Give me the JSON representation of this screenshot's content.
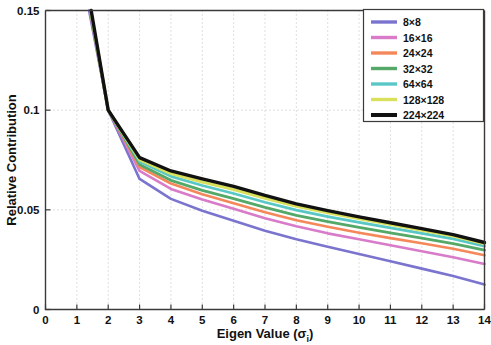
{
  "chart_data": {
    "type": "line",
    "title": "",
    "xlabel": "Eigen Value (σᵢ)",
    "ylabel": "Relative Contribution",
    "xlim": [
      0,
      14
    ],
    "ylim": [
      0,
      0.15
    ],
    "xticks": [
      "0",
      "1",
      "2",
      "3",
      "4",
      "5",
      "6",
      "7",
      "8",
      "9",
      "10",
      "11",
      "12",
      "13",
      "14"
    ],
    "yticks": [
      "0",
      "0.05",
      "0.1",
      "0.15"
    ],
    "ytick_values": [
      0,
      0.05,
      0.1,
      0.15
    ],
    "grid": true,
    "grid_style": "dotted",
    "legend_position": "top-right",
    "x": [
      1,
      2,
      3,
      4,
      5,
      6,
      7,
      8,
      9,
      10,
      11,
      12,
      13,
      14
    ],
    "series": [
      {
        "name": "8×8",
        "color": "#7b74cf",
        "values": [
          0.182,
          0.1,
          0.0655,
          0.0555,
          0.0495,
          0.0445,
          0.0395,
          0.0352,
          0.0315,
          0.0278,
          0.0242,
          0.0205,
          0.0168,
          0.0125
        ]
      },
      {
        "name": "16×16",
        "color": "#d87bc8",
        "values": [
          0.185,
          0.1,
          0.0695,
          0.0605,
          0.0552,
          0.0505,
          0.0458,
          0.0418,
          0.0382,
          0.0352,
          0.0322,
          0.0292,
          0.0262,
          0.0228
        ]
      },
      {
        "name": "24×24",
        "color": "#f5885a",
        "values": [
          0.187,
          0.1,
          0.0715,
          0.0632,
          0.0578,
          0.0533,
          0.0488,
          0.0448,
          0.0415,
          0.0385,
          0.0358,
          0.0332,
          0.0305,
          0.0272
        ]
      },
      {
        "name": "32×32",
        "color": "#55a968",
        "values": [
          0.188,
          0.1,
          0.0728,
          0.0648,
          0.0598,
          0.0556,
          0.0512,
          0.0472,
          0.0441,
          0.0412,
          0.0385,
          0.0358,
          0.0331,
          0.0298
        ]
      },
      {
        "name": "64×64",
        "color": "#5ac7c7",
        "values": [
          0.189,
          0.1,
          0.0742,
          0.0668,
          0.0622,
          0.0582,
          0.0538,
          0.0498,
          0.0466,
          0.0437,
          0.0409,
          0.0382,
          0.0354,
          0.0318
        ]
      },
      {
        "name": "128×128",
        "color": "#d8e05c",
        "values": [
          0.19,
          0.1,
          0.0752,
          0.0682,
          0.064,
          0.0602,
          0.0558,
          0.0518,
          0.0485,
          0.0455,
          0.0426,
          0.0398,
          0.0368,
          0.033
        ]
      },
      {
        "name": "224×224",
        "color": "#111111",
        "values": [
          0.192,
          0.1,
          0.0762,
          0.0695,
          0.0655,
          0.0618,
          0.0572,
          0.053,
          0.0496,
          0.0465,
          0.0435,
          0.0406,
          0.0376,
          0.0336
        ]
      }
    ]
  },
  "legend": {
    "entries": [
      {
        "label": "8×8"
      },
      {
        "label": "16×16"
      },
      {
        "label": "24×24"
      },
      {
        "label": "32×32"
      },
      {
        "label": "64×64"
      },
      {
        "label": "128×128"
      },
      {
        "label": "224×224"
      }
    ]
  }
}
